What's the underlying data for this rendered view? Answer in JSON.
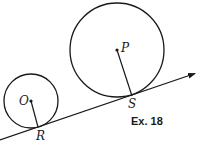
{
  "diagram": {
    "caption": "Ex. 18",
    "stroke_color": "#1a1a1a",
    "tangent_line": {
      "x1": 0,
      "y1": 140,
      "x2": 196,
      "y2": 73,
      "arrow": true
    },
    "circles": [
      {
        "label": "O",
        "center": [
          31,
          101
        ],
        "radius": 27,
        "tangent_point": {
          "label": "R",
          "pos": [
            38,
            127
          ]
        }
      },
      {
        "label": "P",
        "center": [
          117,
          50
        ],
        "radius": 47,
        "tangent_point": {
          "label": "S",
          "pos": [
            132,
            95
          ]
        }
      }
    ],
    "labels": {
      "O": "O",
      "R": "R",
      "P": "P",
      "S": "S"
    }
  }
}
